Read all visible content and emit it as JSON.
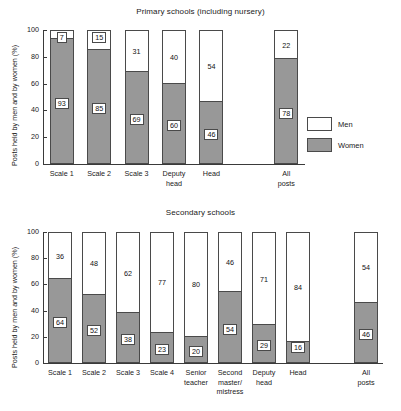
{
  "legend": {
    "men_label": "Men",
    "women_label": "Women",
    "men_color": "#ffffff",
    "women_color": "#989898"
  },
  "axis": {
    "ylabel": "Posts held by men and by women (%)",
    "yticks": [
      "100",
      "80",
      "60",
      "40",
      "20",
      "0"
    ]
  },
  "chart_data": [
    {
      "type": "bar",
      "title": "Primary schools (including nursery)",
      "xlabel": "",
      "ylabel": "Posts held by men and by women (%)",
      "ylim": [
        0,
        100
      ],
      "yticks": [
        0,
        20,
        40,
        60,
        80,
        100
      ],
      "grid": false,
      "stacked": true,
      "legend_position": "right",
      "categories": [
        "Scale 1",
        "Scale 2",
        "Scale 3",
        "Deputy head",
        "Head",
        "All posts"
      ],
      "series": [
        {
          "name": "Women",
          "values": [
            93,
            85,
            69,
            60,
            46,
            78
          ]
        },
        {
          "name": "Men",
          "values": [
            7,
            15,
            31,
            40,
            54,
            22
          ]
        }
      ]
    },
    {
      "type": "bar",
      "title": "Secondary schools",
      "xlabel": "",
      "ylabel": "Posts held by men and by women (%)",
      "ylim": [
        0,
        100
      ],
      "yticks": [
        0,
        20,
        40,
        60,
        80,
        100
      ],
      "grid": false,
      "stacked": true,
      "legend_position": "none",
      "categories": [
        "Scale 1",
        "Scale 2",
        "Scale 3",
        "Scale 4",
        "Senior teacher",
        "Second master/ mistress",
        "Deputy head",
        "Head",
        "All posts"
      ],
      "series": [
        {
          "name": "Women",
          "values": [
            64,
            52,
            38,
            23,
            20,
            54,
            29,
            16,
            46
          ]
        },
        {
          "name": "Men",
          "values": [
            36,
            48,
            62,
            77,
            80,
            46,
            71,
            84,
            54
          ]
        }
      ]
    }
  ]
}
